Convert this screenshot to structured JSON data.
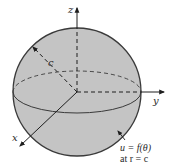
{
  "diagram": {
    "type": "sphere-spherical-coordinates",
    "colors": {
      "sphere_fill": "#c4c4c4",
      "outline": "#3a3a3a",
      "axis": "#1e1e1e",
      "background": "#ffffff"
    },
    "axes": {
      "z_label": "z",
      "y_label": "y",
      "x_label": "x"
    },
    "radius_label": "c",
    "annotation": {
      "line1": "u = f(θ)",
      "line2": "at r = c"
    }
  }
}
